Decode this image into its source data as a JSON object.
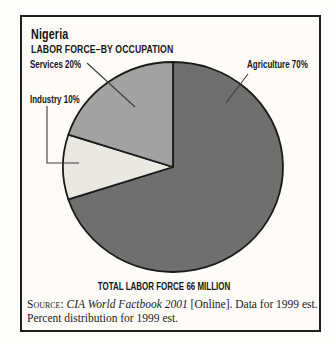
{
  "chart_data": {
    "type": "pie",
    "title": "Nigeria",
    "subtitle": "LABOR FORCE–BY OCCUPATION",
    "footer": "TOTAL LABOR FORCE 66 MILLION",
    "total_labor_force": "66 MILLION",
    "start_angle_deg": -90,
    "direction": "clockwise",
    "slices": [
      {
        "label": "Agriculture",
        "value": 70,
        "unit": "%",
        "color": "#6f6f6f",
        "callout": "Agriculture 70%"
      },
      {
        "label": "Industry",
        "value": 10,
        "unit": "%",
        "color": "#eae8e2",
        "callout": "Industry 10%"
      },
      {
        "label": "Services",
        "value": 20,
        "unit": "%",
        "color": "#a2a2a2",
        "callout": "Services 20%"
      }
    ]
  },
  "source": {
    "line1_prefix": "Source:",
    "line1_italic": "CIA World Factbook 2001",
    "line1_rest": " [Online]. Data for 1999 est.",
    "line2": "Percent distribution for 1999 est."
  },
  "colors": {
    "card_border": "#1e1e1e",
    "leader_line": "#3c3c3c",
    "pie_stroke": "#1a1a1a",
    "background": "#fdfdfb"
  }
}
